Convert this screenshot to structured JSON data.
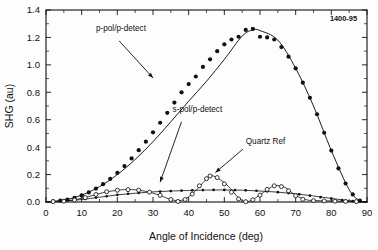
{
  "figure": {
    "corner_id": "1400-95"
  },
  "chart_data": {
    "type": "scatter",
    "title": "",
    "xlabel": "Angle of Incidence (deg)",
    "ylabel": "SHG (au)",
    "xlim": [
      0,
      90
    ],
    "ylim": [
      0.0,
      1.4
    ],
    "xticks": [
      0,
      10,
      20,
      30,
      40,
      50,
      60,
      70,
      80,
      90
    ],
    "xtick_labels": [
      "0",
      "10",
      "20",
      "30",
      "40",
      "50",
      "60",
      "70",
      "80",
      "90"
    ],
    "yticks": [
      0.0,
      0.2,
      0.4,
      0.6,
      0.8,
      1.0,
      1.2,
      1.4
    ],
    "ytick_labels": [
      "0.0",
      "0.2",
      "0.4",
      "0.6",
      "0.8",
      "1.0",
      "1.2",
      "1.4"
    ],
    "grid": false,
    "legend_position": "inline-annotations",
    "annotations": [
      {
        "name": "p-pol-annotation",
        "text": "p-pol/p-detect",
        "text_x": 14.0,
        "text_y": 1.245,
        "arrow_from_x": 20.5,
        "arrow_from_y": 1.175,
        "arrow_to_x": 30.0,
        "arrow_to_y": 0.905
      },
      {
        "name": "s-pol-annotation",
        "text": "s-pol/p-detect",
        "text_x": 35.5,
        "text_y": 0.655,
        "arrow_from_x": 38.0,
        "arrow_from_y": 0.585,
        "arrow_to_x": 32.0,
        "arrow_to_y": 0.145
      },
      {
        "name": "quartz-ref-annotation",
        "text": "Quartz Ref",
        "text_x": 56.0,
        "text_y": 0.425,
        "arrow_from_x": 55.2,
        "arrow_from_y": 0.385,
        "arrow_to_x": 47.5,
        "arrow_to_y": 0.215
      }
    ],
    "series": [
      {
        "name": "p-pol/p-detect",
        "marker": "filled-circle",
        "marker_size": 2.1,
        "has_fit_curve": true,
        "x": [
          2,
          4,
          6,
          8,
          10,
          12,
          14,
          16,
          18,
          20,
          22,
          24,
          26,
          28,
          30,
          32,
          34,
          36,
          38,
          40,
          42,
          44,
          46,
          48,
          50,
          52,
          54,
          56,
          58,
          60,
          62,
          64,
          66,
          68,
          70,
          72,
          74,
          76,
          78,
          80,
          82,
          84,
          86,
          88
        ],
        "y": [
          0.005,
          0.01,
          0.018,
          0.03,
          0.048,
          0.07,
          0.098,
          0.13,
          0.168,
          0.212,
          0.262,
          0.318,
          0.378,
          0.44,
          0.508,
          0.578,
          0.65,
          0.725,
          0.8,
          0.86,
          0.915,
          0.985,
          1.04,
          1.1,
          1.15,
          1.185,
          1.205,
          1.255,
          1.262,
          1.205,
          1.2,
          1.185,
          1.13,
          1.06,
          0.975,
          0.87,
          0.76,
          0.64,
          0.505,
          0.375,
          0.245,
          0.135,
          0.055,
          0.01
        ],
        "fit_x": [
          0,
          5,
          10,
          15,
          20,
          25,
          30,
          35,
          40,
          45,
          50,
          55,
          58,
          60,
          65,
          70,
          75,
          80,
          85,
          88,
          90
        ],
        "fit_y": [
          0.0,
          0.014,
          0.05,
          0.112,
          0.2,
          0.31,
          0.44,
          0.585,
          0.735,
          0.88,
          1.04,
          1.21,
          1.255,
          1.25,
          1.18,
          0.975,
          0.7,
          0.375,
          0.09,
          0.01,
          0.0
        ]
      },
      {
        "name": "s-pol/p-detect",
        "marker": "small-filled-circle",
        "marker_size": 1.35,
        "has_fit_curve": true,
        "x": [
          2,
          5,
          8,
          11,
          14,
          17,
          20,
          23,
          26,
          29,
          32,
          35,
          38,
          41,
          44,
          47,
          50,
          53,
          56,
          59,
          62,
          65,
          68,
          71,
          74,
          77,
          80,
          83,
          86,
          88
        ],
        "y": [
          0.004,
          0.008,
          0.014,
          0.022,
          0.032,
          0.042,
          0.052,
          0.06,
          0.066,
          0.071,
          0.076,
          0.08,
          0.083,
          0.085,
          0.087,
          0.088,
          0.088,
          0.087,
          0.085,
          0.082,
          0.078,
          0.072,
          0.065,
          0.056,
          0.046,
          0.035,
          0.024,
          0.014,
          0.006,
          0.003
        ],
        "fit_x": [
          0,
          5,
          10,
          15,
          20,
          25,
          30,
          35,
          40,
          45,
          50,
          55,
          60,
          65,
          70,
          75,
          80,
          85,
          90
        ],
        "fit_y": [
          0.002,
          0.008,
          0.018,
          0.035,
          0.052,
          0.064,
          0.074,
          0.08,
          0.084,
          0.087,
          0.088,
          0.086,
          0.08,
          0.072,
          0.06,
          0.044,
          0.026,
          0.01,
          0.0
        ]
      },
      {
        "name": "Quartz Ref",
        "marker": "open-circle",
        "marker_size": 2.0,
        "has_fit_curve": true,
        "x": [
          2,
          5,
          8,
          11,
          14,
          17,
          20,
          23,
          26,
          29,
          32,
          35,
          37,
          39,
          41,
          43,
          45,
          46,
          48,
          50,
          52,
          54,
          56,
          58,
          60,
          62,
          64,
          66,
          68,
          70,
          72,
          75,
          78,
          81,
          84,
          87
        ],
        "y": [
          0.003,
          0.006,
          0.015,
          0.032,
          0.055,
          0.075,
          0.086,
          0.09,
          0.086,
          0.072,
          0.048,
          0.018,
          0.004,
          0.018,
          0.058,
          0.118,
          0.17,
          0.19,
          0.178,
          0.132,
          0.072,
          0.022,
          0.002,
          0.016,
          0.05,
          0.092,
          0.118,
          0.112,
          0.082,
          0.046,
          0.02,
          0.01,
          0.008,
          0.006,
          0.004,
          0.003
        ],
        "fit_x": [
          0,
          4,
          8,
          12,
          16,
          20,
          24,
          28,
          32,
          35,
          38,
          41,
          44,
          46,
          48,
          51,
          54,
          56,
          58,
          61,
          64,
          67,
          70,
          73,
          76,
          80,
          84,
          88,
          90
        ],
        "fit_y": [
          0.0,
          0.004,
          0.016,
          0.04,
          0.068,
          0.086,
          0.091,
          0.078,
          0.048,
          0.018,
          0.012,
          0.058,
          0.14,
          0.19,
          0.176,
          0.118,
          0.03,
          0.002,
          0.018,
          0.07,
          0.118,
          0.106,
          0.048,
          0.016,
          0.01,
          0.008,
          0.005,
          0.002,
          0.0
        ]
      }
    ]
  }
}
